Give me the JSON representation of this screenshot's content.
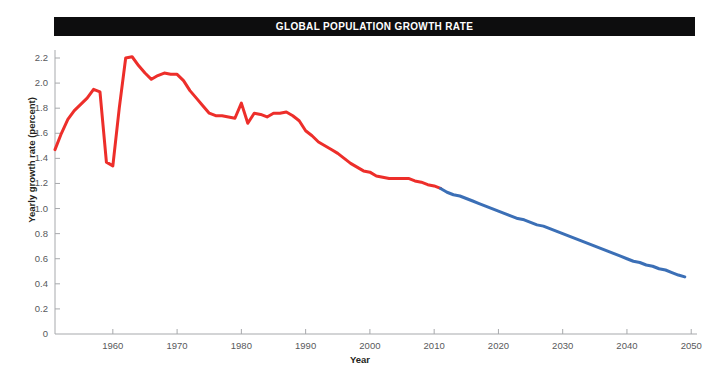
{
  "chart_data": {
    "type": "line",
    "title": "GLOBAL POPULATION GROWTH RATE",
    "xlabel": "Year",
    "ylabel": "Yearly growth rate (percent)",
    "xlim": [
      1951,
      2050
    ],
    "ylim": [
      0,
      2.3
    ],
    "grid": false,
    "legend": "none",
    "xticks": [
      1960,
      1970,
      1980,
      1990,
      2000,
      2010,
      2020,
      2030,
      2040,
      2050
    ],
    "xtick_labels": [
      "1960",
      "1970",
      "1980",
      "1990",
      "2000",
      "2010",
      "2020",
      "2030",
      "2040",
      "2050"
    ],
    "yticks": [
      0,
      0.2,
      0.4,
      0.6,
      0.8,
      1.0,
      1.2,
      1.4,
      1.6,
      1.8,
      2.0,
      2.2
    ],
    "ytick_labels": [
      "0",
      "0.2",
      "0.4",
      "0.6",
      "0.8",
      "1.0",
      "1.2",
      "1.4",
      "1.6",
      "1.8",
      "2.0",
      "2.2"
    ],
    "colors": {
      "estimate": "#ed2e2a",
      "projection": "#3b6fb6",
      "title_band": "#0d0d0e",
      "title_text": "#ffffff",
      "axis": "#a7a9ac",
      "tick_text": "#58595b",
      "axis_label": "#231f20"
    },
    "series": [
      {
        "name": "Estimates",
        "color": "#ed2e2a",
        "x": [
          1951,
          1952,
          1953,
          1954,
          1955,
          1956,
          1957,
          1958,
          1959,
          1960,
          1961,
          1962,
          1963,
          1964,
          1965,
          1966,
          1967,
          1968,
          1969,
          1970,
          1971,
          1972,
          1973,
          1974,
          1975,
          1976,
          1977,
          1978,
          1979,
          1980,
          1981,
          1982,
          1983,
          1984,
          1985,
          1986,
          1987,
          1988,
          1989,
          1990,
          1991,
          1992,
          1993,
          1994,
          1995,
          1996,
          1997,
          1998,
          1999,
          2000,
          2001,
          2002,
          2003,
          2004,
          2005,
          2006,
          2007,
          2008,
          2009,
          2010,
          2011
        ],
        "y": [
          1.47,
          1.6,
          1.71,
          1.78,
          1.83,
          1.88,
          1.95,
          1.93,
          1.37,
          1.34,
          1.8,
          2.2,
          2.21,
          2.14,
          2.08,
          2.03,
          2.06,
          2.08,
          2.07,
          2.07,
          2.02,
          1.94,
          1.88,
          1.82,
          1.76,
          1.74,
          1.74,
          1.73,
          1.72,
          1.84,
          1.68,
          1.76,
          1.75,
          1.73,
          1.76,
          1.76,
          1.77,
          1.74,
          1.7,
          1.62,
          1.58,
          1.53,
          1.5,
          1.47,
          1.44,
          1.4,
          1.36,
          1.33,
          1.3,
          1.29,
          1.26,
          1.25,
          1.24,
          1.24,
          1.24,
          1.24,
          1.22,
          1.21,
          1.19,
          1.18,
          1.16
        ]
      },
      {
        "name": "Projections",
        "color": "#3b6fb6",
        "x": [
          2011,
          2012,
          2013,
          2014,
          2015,
          2016,
          2017,
          2018,
          2019,
          2020,
          2021,
          2022,
          2023,
          2024,
          2025,
          2026,
          2027,
          2028,
          2029,
          2030,
          2031,
          2032,
          2033,
          2034,
          2035,
          2036,
          2037,
          2038,
          2039,
          2040,
          2041,
          2042,
          2043,
          2044,
          2045,
          2046,
          2047,
          2048,
          2049
        ],
        "y": [
          1.16,
          1.13,
          1.11,
          1.1,
          1.08,
          1.06,
          1.04,
          1.02,
          1.0,
          0.98,
          0.96,
          0.94,
          0.92,
          0.91,
          0.89,
          0.87,
          0.86,
          0.84,
          0.82,
          0.8,
          0.78,
          0.76,
          0.74,
          0.72,
          0.7,
          0.68,
          0.66,
          0.64,
          0.62,
          0.6,
          0.58,
          0.57,
          0.55,
          0.54,
          0.52,
          0.51,
          0.49,
          0.47,
          0.455
        ]
      }
    ]
  },
  "figure": {
    "title": "GLOBAL POPULATION GROWTH RATE",
    "xlabel": "Year",
    "ylabel": "Yearly growth rate (percent)"
  }
}
